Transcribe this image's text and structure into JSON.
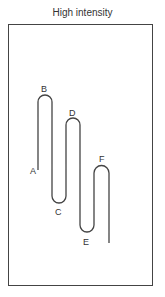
{
  "title": "High intensity",
  "diagram": {
    "type": "waveform-trace",
    "points": [
      {
        "label": "A",
        "position": "start"
      },
      {
        "label": "B",
        "position": "peak"
      },
      {
        "label": "C",
        "position": "trough"
      },
      {
        "label": "D",
        "position": "peak"
      },
      {
        "label": "E",
        "position": "trough"
      },
      {
        "label": "F",
        "position": "peak"
      }
    ]
  },
  "colors": {
    "line": "#444444",
    "text": "#333333"
  }
}
